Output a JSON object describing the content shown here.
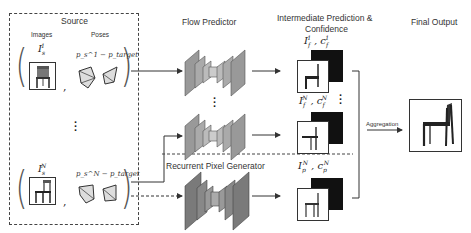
{
  "source": {
    "title": "Source",
    "images_label": "Images",
    "poses_label": "Poses",
    "item1": {
      "image_label": "I_s^1",
      "pose_label": "p_s^1 − p_target"
    },
    "itemN": {
      "image_label": "I_s^N",
      "pose_label": "p_s^N − p_target"
    },
    "comma": ","
  },
  "flow_predictor": {
    "title": "Flow Predictor"
  },
  "recurrent": {
    "title": "Recurrent Pixel Generator"
  },
  "intermediate": {
    "title_line1": "Intermediate Prediction &",
    "title_line2": "Confidence",
    "item1": {
      "label": "I_f^1, c_f^1"
    },
    "itemN": {
      "label": "I_f^N, c_f^N"
    },
    "pixel": {
      "label": "I_p^N, c_p^N"
    }
  },
  "aggregation": {
    "label": "Aggregation"
  },
  "final_output": {
    "title": "Final Output"
  },
  "colors": {
    "line": "#333333",
    "encoder": "#8a8a8a",
    "dark_panel": "#111111"
  }
}
